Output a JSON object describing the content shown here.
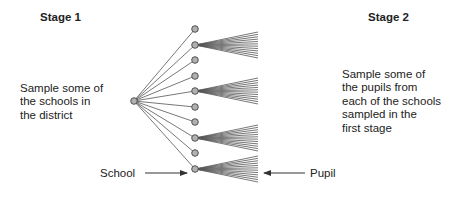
{
  "stage1": {
    "title": "Stage 1",
    "description_lines": [
      "Sample some of",
      "the schools in",
      "the district"
    ]
  },
  "stage2": {
    "title": "Stage 2",
    "description_lines": [
      "Sample some of",
      "the pupils from",
      "each of the schools",
      "sampled in the",
      "first stage"
    ]
  },
  "labels": {
    "school": "School",
    "pupil": "Pupil"
  },
  "tree": {
    "root": {
      "x": 134,
      "y": 101
    },
    "school_x": 195,
    "school_ys": [
      29,
      45,
      60,
      76,
      91,
      107,
      122,
      138,
      153,
      169
    ],
    "sampled_school_indices": [
      1,
      4,
      7,
      9
    ],
    "pupils_per_school": 12,
    "pupil_fan_end_x": 258,
    "pupil_fan_spread": 26
  },
  "colors": {
    "line": "#555555",
    "node_fill": "#b0b0b0",
    "node_stroke": "#444444",
    "text": "#222222"
  }
}
